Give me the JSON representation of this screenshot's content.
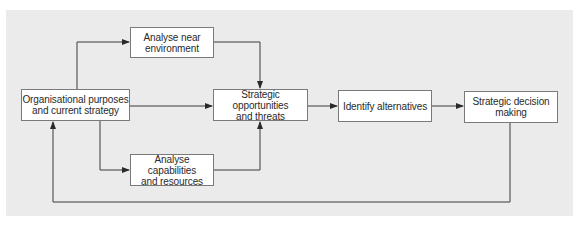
{
  "diagram": {
    "background_color": "#ebebeb",
    "line_color": "#3a3a3a",
    "nodes": [
      {
        "id": "org",
        "label": "Organisational purposes and current strategy",
        "lines": [
          "Organisational purposes",
          "and current strategy"
        ]
      },
      {
        "id": "near",
        "label": "Analyse near environment",
        "lines": [
          "Analyse near",
          "environment"
        ]
      },
      {
        "id": "cap",
        "label": "Analyse capabilities and resources",
        "lines": [
          "Analyse capabilities",
          "and resources"
        ]
      },
      {
        "id": "opp",
        "label": "Strategic opportunities and threats",
        "lines": [
          "Strategic opportunities",
          "and threats"
        ]
      },
      {
        "id": "alt",
        "label": "Identify alternatives",
        "lines": [
          "Identify alternatives"
        ]
      },
      {
        "id": "dec",
        "label": "Strategic decision making",
        "lines": [
          "Strategic decision",
          "making"
        ]
      }
    ],
    "edges": [
      {
        "from": "org",
        "to": "near"
      },
      {
        "from": "org",
        "to": "opp"
      },
      {
        "from": "org",
        "to": "cap"
      },
      {
        "from": "near",
        "to": "opp"
      },
      {
        "from": "cap",
        "to": "opp"
      },
      {
        "from": "opp",
        "to": "alt"
      },
      {
        "from": "alt",
        "to": "dec"
      },
      {
        "from": "dec",
        "to": "org",
        "type": "feedback"
      }
    ]
  }
}
